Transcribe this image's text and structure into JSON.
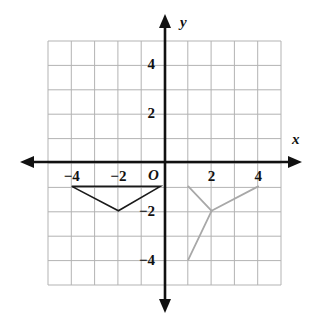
{
  "figure": {
    "width": 322,
    "height": 324,
    "background": "#ffffff",
    "axis_color": "#111111",
    "grid_color": "#b3b3b3"
  },
  "axes": {
    "x_label": "x",
    "y_label": "y",
    "origin_label": "O",
    "x_ticks": [
      {
        "value": -4,
        "label": "−4"
      },
      {
        "value": -2,
        "label": "−2"
      },
      {
        "value": 2,
        "label": "2"
      },
      {
        "value": 4,
        "label": "4"
      }
    ],
    "y_ticks": [
      {
        "value": 4,
        "label": "4"
      },
      {
        "value": 2,
        "label": "2"
      },
      {
        "value": -2,
        "label": "−2"
      },
      {
        "value": -4,
        "label": "−4"
      }
    ]
  },
  "chart_data": {
    "type": "scatter",
    "title": "",
    "xlabel": "x",
    "ylabel": "y",
    "grid": true,
    "legend": "none",
    "xlim": [
      -5,
      5
    ],
    "ylim": [
      -5,
      5
    ],
    "x_ticks": [
      -4,
      -2,
      2,
      4
    ],
    "y_ticks": [
      -4,
      -2,
      2,
      4
    ],
    "x_tick_labels": [
      "−4",
      "−2",
      "2",
      "4"
    ],
    "y_tick_labels": [
      "−4",
      "−2",
      "2",
      "4"
    ],
    "gridline_step": 1,
    "series": [
      {
        "name": "pre-image-triangle",
        "type": "polygon",
        "color": "#1a1a1a",
        "closed": true,
        "stroke_width": 1.6,
        "points": [
          {
            "x": -4,
            "y": -1
          },
          {
            "x": -0.2,
            "y": -1
          },
          {
            "x": -2,
            "y": -2
          }
        ]
      },
      {
        "name": "image-figure",
        "type": "polyline-fan",
        "color": "#a8a8a8",
        "closed": false,
        "stroke_width": 1.8,
        "center": {
          "x": 2,
          "y": -2
        },
        "spokes": [
          {
            "x": 1,
            "y": -1
          },
          {
            "x": 4,
            "y": -1
          },
          {
            "x": 1,
            "y": -4
          }
        ]
      }
    ]
  }
}
